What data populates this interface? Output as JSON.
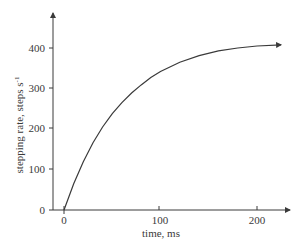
{
  "chart_data": {
    "type": "line",
    "title": "",
    "xlabel": "time, ms",
    "ylabel": "stepping rate, steps s",
    "ylabel_superscript": "-1",
    "x_ticks": [
      "0",
      "100",
      "200"
    ],
    "y_ticks": [
      "0",
      "100",
      "200",
      "300",
      "400"
    ],
    "xlim": [
      0,
      235
    ],
    "ylim": [
      0,
      470
    ],
    "grid": false,
    "legend": null,
    "series": [
      {
        "name": "stepping rate",
        "x": [
          0,
          10,
          20,
          30,
          40,
          50,
          60,
          70,
          80,
          90,
          100,
          120,
          140,
          160,
          180,
          200,
          225
        ],
        "values": [
          0,
          65,
          119,
          166,
          205,
          238,
          265,
          289,
          309,
          327,
          342,
          365,
          381,
          393,
          400,
          405,
          408
        ]
      }
    ],
    "curve_end_arrow": true,
    "colors": {
      "line": "#3a3a3a",
      "axis": "#3a3a3a",
      "text": "#3a3a3a"
    }
  }
}
